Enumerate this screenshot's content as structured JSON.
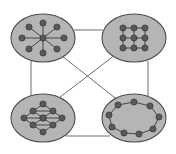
{
  "figure": {
    "title": "",
    "background_color": "#ffffff",
    "width": 176,
    "height": 154
  },
  "style": {
    "blob_fill": "#b5b5b5",
    "blob_stroke": "#4d4d4d",
    "blob_stroke_width": 1.1,
    "node_fill": "#595959",
    "node_stroke": "#2b2b2b",
    "node_stroke_width": 0.6,
    "node_radius": 3.1,
    "intra_edge_color": "#3a3a3a",
    "intra_edge_width": 0.9,
    "inter_edge_color": "#6e6e6e",
    "inter_edge_width": 1.0
  },
  "chart_data": {
    "type": "graph",
    "layout": "clustered / community structure",
    "cluster_count": 4,
    "total_nodes": 37,
    "total_inter_edges": 6,
    "clusters": [
      {
        "id": "top-left",
        "topology": "star",
        "label": "",
        "node_count": 9,
        "ellipse": {
          "cx": 43,
          "cy": 38,
          "rx": 32,
          "ry": 24
        },
        "nodes": [
          {
            "id": "c",
            "x": 43,
            "y": 38
          },
          {
            "id": "s1",
            "x": 43,
            "y": 23
          },
          {
            "id": "s2",
            "x": 57,
            "y": 27
          },
          {
            "id": "s3",
            "x": 64,
            "y": 38
          },
          {
            "id": "s4",
            "x": 57,
            "y": 49
          },
          {
            "id": "s5",
            "x": 43,
            "y": 53
          },
          {
            "id": "s6",
            "x": 29,
            "y": 49
          },
          {
            "id": "s7",
            "x": 22,
            "y": 38
          },
          {
            "id": "s8",
            "x": 29,
            "y": 27
          }
        ],
        "edges": [
          [
            "c",
            "s1"
          ],
          [
            "c",
            "s2"
          ],
          [
            "c",
            "s3"
          ],
          [
            "c",
            "s4"
          ],
          [
            "c",
            "s5"
          ],
          [
            "c",
            "s6"
          ],
          [
            "c",
            "s7"
          ],
          [
            "c",
            "s8"
          ]
        ]
      },
      {
        "id": "top-right",
        "topology": "grid lattice 3x3",
        "label": "",
        "node_count": 9,
        "ellipse": {
          "cx": 134,
          "cy": 38,
          "rx": 32,
          "ry": 24
        },
        "nodes": [
          {
            "id": "g11",
            "x": 123,
            "y": 28
          },
          {
            "id": "g12",
            "x": 134,
            "y": 28
          },
          {
            "id": "g13",
            "x": 145,
            "y": 28
          },
          {
            "id": "g21",
            "x": 123,
            "y": 38
          },
          {
            "id": "g22",
            "x": 134,
            "y": 38
          },
          {
            "id": "g23",
            "x": 145,
            "y": 38
          },
          {
            "id": "g31",
            "x": 123,
            "y": 48
          },
          {
            "id": "g32",
            "x": 134,
            "y": 48
          },
          {
            "id": "g33",
            "x": 145,
            "y": 48
          }
        ],
        "edges": [
          [
            "g11",
            "g12"
          ],
          [
            "g12",
            "g13"
          ],
          [
            "g21",
            "g22"
          ],
          [
            "g22",
            "g23"
          ],
          [
            "g31",
            "g32"
          ],
          [
            "g32",
            "g33"
          ],
          [
            "g11",
            "g21"
          ],
          [
            "g21",
            "g31"
          ],
          [
            "g12",
            "g22"
          ],
          [
            "g22",
            "g32"
          ],
          [
            "g13",
            "g23"
          ],
          [
            "g23",
            "g33"
          ]
        ]
      },
      {
        "id": "bottom-left",
        "topology": "triangular lattice",
        "label": "",
        "node_count": 10,
        "ellipse": {
          "cx": 43,
          "cy": 118,
          "rx": 32,
          "ry": 24
        },
        "nodes": [
          {
            "id": "t1",
            "x": 43,
            "y": 104
          },
          {
            "id": "t2",
            "x": 33,
            "y": 111
          },
          {
            "id": "t3",
            "x": 53,
            "y": 111
          },
          {
            "id": "t4",
            "x": 24,
            "y": 118
          },
          {
            "id": "t5",
            "x": 43,
            "y": 118
          },
          {
            "id": "t6",
            "x": 62,
            "y": 118
          },
          {
            "id": "t7",
            "x": 33,
            "y": 125
          },
          {
            "id": "t8",
            "x": 53,
            "y": 125
          },
          {
            "id": "t9",
            "x": 43,
            "y": 132
          },
          {
            "id": "t10",
            "x": 43,
            "y": 118
          }
        ],
        "edges": [
          [
            "t1",
            "t2"
          ],
          [
            "t1",
            "t3"
          ],
          [
            "t2",
            "t3"
          ],
          [
            "t2",
            "t4"
          ],
          [
            "t2",
            "t5"
          ],
          [
            "t3",
            "t5"
          ],
          [
            "t3",
            "t6"
          ],
          [
            "t4",
            "t5"
          ],
          [
            "t5",
            "t6"
          ],
          [
            "t4",
            "t7"
          ],
          [
            "t5",
            "t7"
          ],
          [
            "t5",
            "t8"
          ],
          [
            "t6",
            "t8"
          ],
          [
            "t7",
            "t8"
          ],
          [
            "t7",
            "t9"
          ],
          [
            "t8",
            "t9"
          ]
        ]
      },
      {
        "id": "bottom-right",
        "topology": "ring cycle",
        "label": "",
        "node_count": 9,
        "ellipse": {
          "cx": 134,
          "cy": 118,
          "rx": 32,
          "ry": 24
        },
        "nodes": [
          {
            "id": "r1",
            "x": 134,
            "y": 102
          },
          {
            "id": "r2",
            "x": 150,
            "y": 106
          },
          {
            "id": "r3",
            "x": 159,
            "y": 117
          },
          {
            "id": "r4",
            "x": 153,
            "y": 129
          },
          {
            "id": "r5",
            "x": 139,
            "y": 134
          },
          {
            "id": "r6",
            "x": 124,
            "y": 133
          },
          {
            "id": "r7",
            "x": 112,
            "y": 127
          },
          {
            "id": "r8",
            "x": 109,
            "y": 115
          },
          {
            "id": "r9",
            "x": 118,
            "y": 105
          }
        ],
        "edges": [
          [
            "r1",
            "r2"
          ],
          [
            "r2",
            "r3"
          ],
          [
            "r3",
            "r4"
          ],
          [
            "r4",
            "r5"
          ],
          [
            "r5",
            "r6"
          ],
          [
            "r6",
            "r7"
          ],
          [
            "r7",
            "r8"
          ],
          [
            "r8",
            "r9"
          ],
          [
            "r9",
            "r1"
          ]
        ]
      }
    ],
    "inter_cluster_edges": [
      {
        "from": "top-left",
        "to": "top-right",
        "kind": "top-horizontal",
        "x1": 74,
        "y1": 30,
        "x2": 103,
        "y2": 30
      },
      {
        "from": "top-left",
        "to": "bottom-left",
        "kind": "left-vertical",
        "x1": 31,
        "y1": 61,
        "x2": 31,
        "y2": 95
      },
      {
        "from": "top-right",
        "to": "bottom-right",
        "kind": "right-vertical",
        "x1": 148,
        "y1": 61,
        "x2": 148,
        "y2": 96
      },
      {
        "from": "bottom-left",
        "to": "bottom-right",
        "kind": "bottom-horizontal",
        "x1": 66,
        "y1": 136,
        "x2": 110,
        "y2": 136
      },
      {
        "from": "top-left",
        "to": "bottom-right",
        "kind": "diagonal-descending",
        "x1": 62,
        "y1": 56,
        "x2": 119,
        "y2": 101
      },
      {
        "from": "top-right",
        "to": "bottom-left",
        "kind": "diagonal-ascending",
        "x1": 115,
        "y1": 55,
        "x2": 55,
        "y2": 101
      }
    ]
  }
}
